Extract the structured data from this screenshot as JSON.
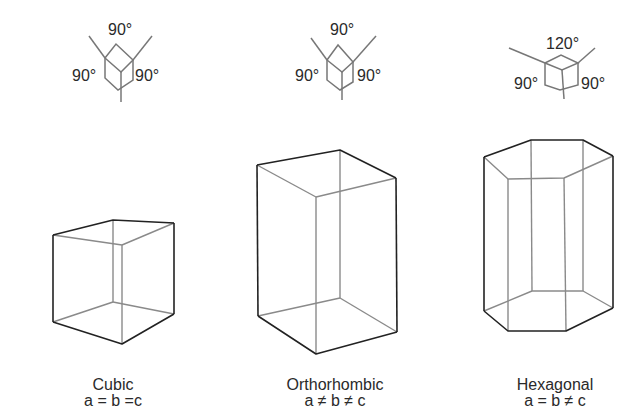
{
  "crystals": [
    {
      "name": "Cubic",
      "relation": "a = b =c",
      "angles": {
        "top": "90°",
        "left": "90°",
        "right": "90°"
      }
    },
    {
      "name": "Orthorhombic",
      "relation": "a ≠ b ≠ c",
      "angles": {
        "top": "90°",
        "left": "90°",
        "right": "90°"
      }
    },
    {
      "name": "Hexagonal",
      "relation": "a = b ≠ c",
      "angles": {
        "top": "120°",
        "left": "90°",
        "right": "90°"
      }
    }
  ],
  "colors": {
    "line_dark": "#222222",
    "line_light": "#8a8a8a",
    "text": "#2a2a2a"
  }
}
